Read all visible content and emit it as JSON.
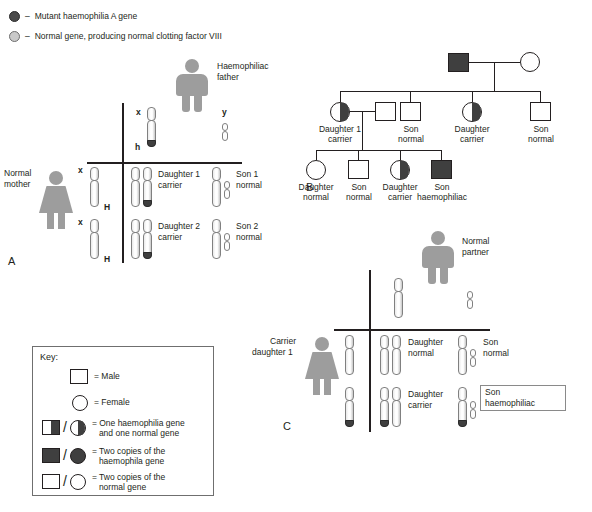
{
  "figure": {
    "panel_letters": {
      "a": "A",
      "b": "B",
      "c": "C"
    }
  },
  "gene_legend": {
    "items": [
      {
        "icon": "mutant-gene-dot",
        "dash": "–",
        "label": "Mutant haemophilia A gene",
        "color": "#4a4a4a"
      },
      {
        "icon": "normal-gene-dot",
        "dash": "–",
        "label": "Normal gene, producing normal clotting factor VIII",
        "color": "#c9c9c9"
      }
    ]
  },
  "panel_a": {
    "letter": "A",
    "father": {
      "label_line1": "Haemophiliac",
      "label_line2": "father",
      "figure": "male-figure"
    },
    "mother": {
      "label_line1": "Normal",
      "label_line2": "mother",
      "figure": "female-figure"
    },
    "father_gametes": [
      {
        "allele": "x",
        "gene": "h",
        "affected": true
      },
      {
        "allele": "y",
        "gene": "",
        "affected": false
      }
    ],
    "mother_gametes": [
      {
        "allele": "x",
        "gene": "H",
        "affected": false
      },
      {
        "allele": "x",
        "gene": "H",
        "affected": false
      }
    ],
    "offspring": [
      {
        "name_line1": "Daughter 1",
        "name_line2": "carrier",
        "sex": "female",
        "carrier": true
      },
      {
        "name_line1": "Son 1",
        "name_line2": "normal",
        "sex": "male",
        "carrier": false
      },
      {
        "name_line1": "Daughter 2",
        "name_line2": "carrier",
        "sex": "female",
        "carrier": true
      },
      {
        "name_line1": "Son 2",
        "name_line2": "normal",
        "sex": "male",
        "carrier": false
      }
    ]
  },
  "panel_b": {
    "letter": "B",
    "generation1": [
      {
        "symbol": "square",
        "fill": "full",
        "label_line1": "",
        "label_line2": ""
      },
      {
        "symbol": "circle",
        "fill": "none",
        "label_line1": "",
        "label_line2": ""
      }
    ],
    "generation2": [
      {
        "symbol": "circle",
        "fill": "half",
        "label_line1": "Daughter 1",
        "label_line2": "carrier"
      },
      {
        "symbol": "square",
        "fill": "none",
        "label_line1": "",
        "label_line2": ""
      },
      {
        "symbol": "square",
        "fill": "none",
        "label_line1": "Son",
        "label_line2": "normal"
      },
      {
        "symbol": "circle",
        "fill": "half",
        "label_line1": "Daughter",
        "label_line2": "carrier"
      },
      {
        "symbol": "square",
        "fill": "none",
        "label_line1": "Son",
        "label_line2": "normal"
      }
    ],
    "generation3": [
      {
        "symbol": "circle",
        "fill": "none",
        "label_line1": "Daughter",
        "label_line2": "normal"
      },
      {
        "symbol": "square",
        "fill": "none",
        "label_line1": "Son",
        "label_line2": "normal"
      },
      {
        "symbol": "circle",
        "fill": "half",
        "label_line1": "Daughter",
        "label_line2": "carrier"
      },
      {
        "symbol": "square",
        "fill": "full",
        "label_line1": "Son",
        "label_line2": "haemophiliac"
      }
    ]
  },
  "panel_c": {
    "letter": "C",
    "father": {
      "label_line1": "Normal",
      "label_line2": "partner",
      "figure": "male-figure"
    },
    "mother": {
      "label_line1": "Carrier",
      "label_line2": "daughter 1",
      "figure": "female-figure"
    },
    "offspring": [
      {
        "name_line1": "Daughter",
        "name_line2": "normal",
        "sex": "female",
        "affected": false
      },
      {
        "name_line1": "Son",
        "name_line2": "normal",
        "sex": "male",
        "affected": false
      },
      {
        "name_line1": "Daughter",
        "name_line2": "carrier",
        "sex": "female",
        "affected": false
      },
      {
        "name_line1": "Son",
        "name_line2": "haemophiliac",
        "sex": "male",
        "affected": true,
        "boxed": true
      }
    ]
  },
  "key": {
    "title": "Key:",
    "entries": [
      {
        "shapes": [
          "square-open"
        ],
        "text_line1": "= Male",
        "text_line2": ""
      },
      {
        "shapes": [
          "circle-open"
        ],
        "text_line1": "= Female",
        "text_line2": ""
      },
      {
        "shapes": [
          "square-half",
          "circle-half"
        ],
        "text_line1": "= One haemophilia gene",
        "text_line2": "and one normal gene"
      },
      {
        "shapes": [
          "square-full",
          "circle-full"
        ],
        "text_line1": "= Two copies of the",
        "text_line2": "haemophila gene"
      },
      {
        "shapes": [
          "square-open",
          "circle-open"
        ],
        "text_line1": "= Two copies of the",
        "text_line2": "normal gene"
      }
    ]
  },
  "colors": {
    "mutant_gene": "#3f3f3f",
    "normal_gene": "#c9c9c9",
    "figure_gray": "#9d9d9d",
    "line_black": "#231f20"
  }
}
